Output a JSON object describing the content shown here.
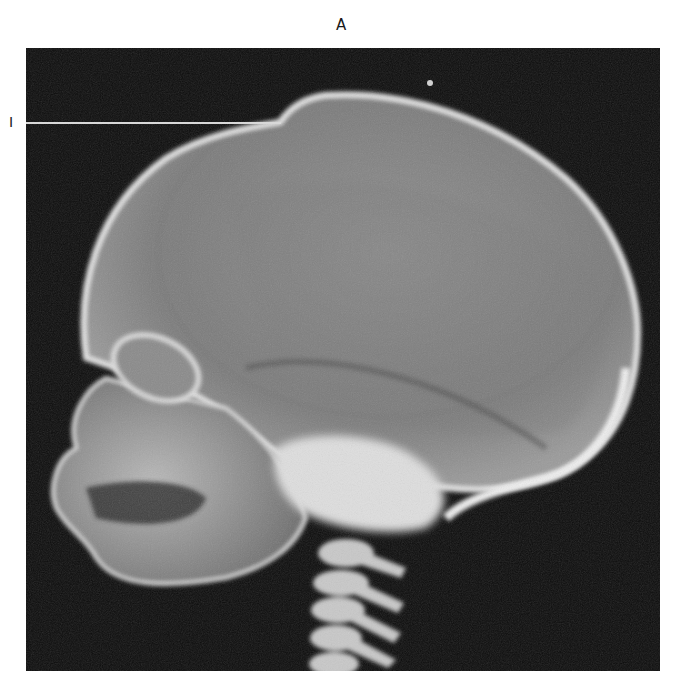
{
  "figure": {
    "panel_letter": "A",
    "callouts": [
      {
        "label": "I",
        "target": "anterior fontanelle / vertex notch"
      }
    ],
    "image": {
      "description": "Lateral skull radiograph (infant), facing left",
      "icon": "xray-skull-image",
      "colors": {
        "background": "#0c0c0c",
        "calvarium_fill": "#8a8a8a",
        "cortex_edge": "#e4e4e4",
        "dense_bone": "#dcdcdc",
        "page": "#ffffff"
      }
    }
  }
}
